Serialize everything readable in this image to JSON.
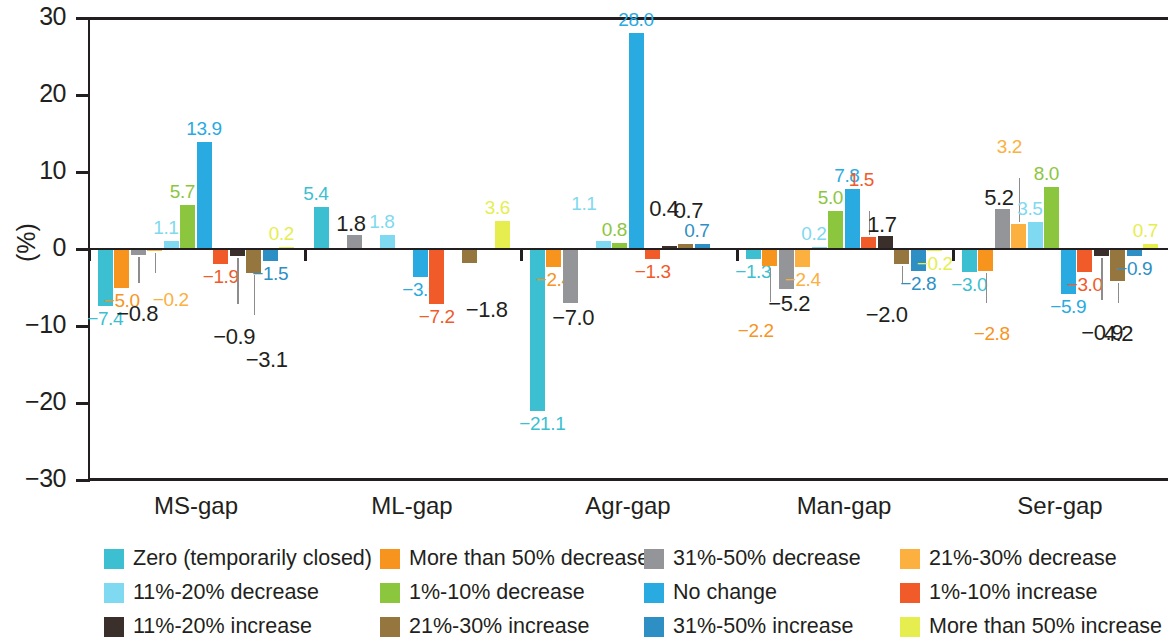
{
  "chart_data": {
    "type": "bar",
    "title": "",
    "subtitle": "",
    "xlabel": "",
    "ylabel": "(%)",
    "ylim": [
      -30,
      30
    ],
    "yticks": [
      30,
      20,
      10,
      0,
      -10,
      -20,
      -30
    ],
    "ytick_labels": [
      "30",
      "20",
      "10",
      "0",
      "−10",
      "−20",
      "−30"
    ],
    "grid": false,
    "legend_position": "bottom",
    "categories": [
      "MS-gap",
      "ML-gap",
      "Agr-gap",
      "Man-gap",
      "Ser-gap"
    ],
    "series": [
      {
        "name": "Zero (temporarily closed)",
        "color": "#3cbfd0",
        "values": [
          -7.4,
          5.4,
          -21.1,
          -1.3,
          -3.0
        ],
        "value_labels": [
          "−7.4",
          "5.4",
          "−21.1",
          "−1.3",
          "−3.0"
        ]
      },
      {
        "name": "More than 50% decrease",
        "color": "#f7941e",
        "values": [
          -5.0,
          0.0,
          -2.4,
          -2.2,
          -2.8
        ],
        "value_labels": [
          "−5.0",
          "",
          "−2.4",
          "−2.2",
          "−2.8"
        ]
      },
      {
        "name": "31%-50% decrease",
        "color": "#939598",
        "values": [
          -0.8,
          1.8,
          -7.0,
          -5.2,
          5.2
        ],
        "value_labels": [
          "−0.8",
          "1.8",
          "−7.0",
          "−5.2",
          "5.2"
        ]
      },
      {
        "name": "21%-30% decrease",
        "color": "#fbb040",
        "values": [
          -0.2,
          0.0,
          0.0,
          -2.4,
          3.2
        ],
        "value_labels": [
          "−0.2",
          "",
          "",
          "−2.4",
          "3.2"
        ]
      },
      {
        "name": "11%-20% decrease",
        "color": "#7fd9f0",
        "values": [
          1.1,
          1.8,
          1.1,
          0.2,
          3.5
        ],
        "value_labels": [
          "1.1",
          "1.8",
          "1.1",
          "0.2",
          "3.5"
        ]
      },
      {
        "name": "1%-10% decrease",
        "color": "#8cc63f",
        "values": [
          5.7,
          0.0,
          0.8,
          5.0,
          8.0
        ],
        "value_labels": [
          "5.7",
          "",
          "0.8",
          "5.0",
          "8.0"
        ]
      },
      {
        "name": "No change",
        "color": "#29aae1",
        "values": [
          13.9,
          -3.6,
          28.0,
          7.8,
          -5.9
        ],
        "value_labels": [
          "13.9",
          "−3.6",
          "28.0",
          "7.8",
          "−5.9"
        ]
      },
      {
        "name": "1%-10% increase",
        "color": "#f15a29",
        "values": [
          -1.9,
          -7.2,
          -1.3,
          1.5,
          -3.0
        ],
        "value_labels": [
          "−1.9",
          "−7.2",
          "−1.3",
          "1.5",
          "−3.0"
        ]
      },
      {
        "name": "11%-20% increase",
        "color": "#3b2f2b",
        "values": [
          -0.9,
          0.0,
          0.4,
          1.7,
          -0.9
        ],
        "value_labels": [
          "−0.9",
          "",
          "0.4",
          "1.7",
          "−0.9"
        ]
      },
      {
        "name": "21%-30% increase",
        "color": "#96763f",
        "values": [
          -3.1,
          -1.8,
          0.7,
          -2.0,
          -4.2
        ],
        "value_labels": [
          "−3.1",
          "−1.8",
          "0.7",
          "−2.0",
          "4.2"
        ]
      },
      {
        "name": "31%-50% increase",
        "color": "#2e8fc4",
        "values": [
          -1.5,
          0.0,
          0.7,
          -2.8,
          -0.9
        ],
        "value_labels": [
          "−1.5",
          "",
          "0.7",
          "−2.8",
          "−0.9"
        ]
      },
      {
        "name": "More than 50% increase",
        "color": "#e6ee4f",
        "values": [
          0.2,
          3.6,
          0.0,
          -0.2,
          0.7
        ],
        "value_labels": [
          "0.2",
          "3.6",
          "",
          "−0.2",
          "0.7"
        ]
      }
    ]
  },
  "legend": {
    "items": [
      {
        "label": "Zero (temporarily closed)",
        "color": "#3cbfd0"
      },
      {
        "label": "More than 50% decrease",
        "color": "#f7941e"
      },
      {
        "label": "31%-50% decrease",
        "color": "#939598"
      },
      {
        "label": "21%-30% decrease",
        "color": "#fbb040"
      },
      {
        "label": "11%-20% decrease",
        "color": "#7fd9f0"
      },
      {
        "label": "1%-10% decrease",
        "color": "#8cc63f"
      },
      {
        "label": "No change",
        "color": "#29aae1"
      },
      {
        "label": "1%-10% increase",
        "color": "#f15a29"
      },
      {
        "label": "11%-20% increase",
        "color": "#3b2f2b"
      },
      {
        "label": "21%-30% increase",
        "color": "#96763f"
      },
      {
        "label": "31%-50% increase",
        "color": "#2e8fc4"
      },
      {
        "label": "More than 50% increase",
        "color": "#e6ee4f"
      }
    ]
  },
  "annotations": {
    "leader_labels": [
      {
        "group": "MS-gap",
        "text": "−0.8"
      },
      {
        "group": "MS-gap",
        "text": "−0.2"
      },
      {
        "group": "MS-gap",
        "text": "−0.9"
      },
      {
        "group": "MS-gap",
        "text": "−3.1"
      },
      {
        "group": "ML-gap",
        "text": "−1.8"
      },
      {
        "group": "Agr-gap",
        "text": "1.1"
      },
      {
        "group": "Agr-gap",
        "text": "0.4"
      },
      {
        "group": "Agr-gap",
        "text": "0.7"
      },
      {
        "group": "Man-gap",
        "text": "−2.2"
      },
      {
        "group": "Man-gap",
        "text": "1.5"
      },
      {
        "group": "Man-gap",
        "text": "−2.0"
      },
      {
        "group": "Ser-gap",
        "text": "3.2"
      },
      {
        "group": "Ser-gap",
        "text": "−2.8"
      },
      {
        "group": "Ser-gap",
        "text": "0.9"
      },
      {
        "group": "Ser-gap",
        "text": "4.2"
      }
    ]
  }
}
